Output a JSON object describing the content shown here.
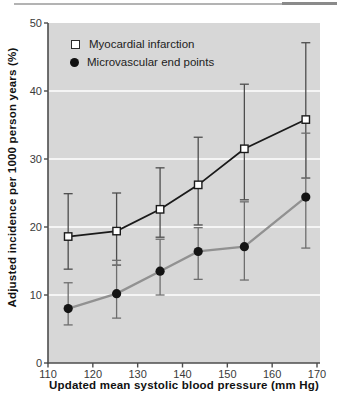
{
  "figure": {
    "top_rule_light_color": "#b3b3b3",
    "top_rule_dark_color": "#8a8a8a"
  },
  "chart_data": {
    "type": "line",
    "title": "",
    "xlabel": "Updated mean systolic blood pressure (mm Hg)",
    "ylabel": "Adjusted incidence per 1000 person years (%)",
    "xlim": [
      110,
      170
    ],
    "ylim": [
      0,
      50
    ],
    "x_ticks": [
      110,
      120,
      130,
      140,
      150,
      160,
      170
    ],
    "y_ticks": [
      0,
      10,
      20,
      30,
      40,
      50
    ],
    "grid": "horizontal white gridlines at 10, 20, 30, 40",
    "legend_position": "top-left inside plot area",
    "plot_bg": "#d7d7d7",
    "grid_color": "#ffffff",
    "axis_color": "#4d4d4d",
    "series": [
      {
        "name": "Myocardial infarction",
        "marker": "open-square",
        "line_color": "#1a1a1a",
        "err_color": "#4d4d4d",
        "x": [
          114.5,
          125.3,
          135.0,
          143.5,
          153.8,
          167.5
        ],
        "y": [
          18.6,
          19.4,
          22.6,
          26.2,
          31.5,
          35.8
        ],
        "err_low": [
          13.8,
          14.4,
          18.5,
          20.3,
          24.0,
          27.2
        ],
        "err_high": [
          24.9,
          25.0,
          28.7,
          33.2,
          41.0,
          47.1
        ]
      },
      {
        "name": "Microvascular end points",
        "marker": "filled-circle",
        "line_color": "#919191",
        "err_color": "#6e6e6e",
        "x": [
          114.5,
          125.3,
          135.0,
          143.5,
          153.8,
          167.5
        ],
        "y": [
          8.0,
          10.2,
          13.5,
          16.4,
          17.1,
          24.4
        ],
        "err_low": [
          5.6,
          6.6,
          10.0,
          12.3,
          12.2,
          16.9
        ],
        "err_high": [
          11.8,
          15.1,
          18.2,
          19.9,
          23.7,
          33.8
        ]
      }
    ]
  }
}
